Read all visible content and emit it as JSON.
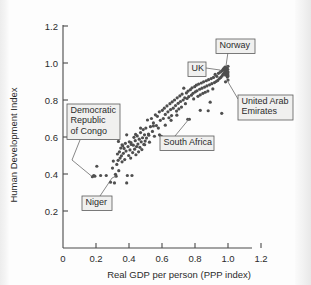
{
  "chart_data": {
    "type": "scatter",
    "title": "",
    "xlabel": "Real GDP per person (PPP index)",
    "ylabel": "Human Development Index",
    "xlim": [
      0,
      1.32
    ],
    "ylim": [
      0,
      1.3
    ],
    "xticks": [
      "0",
      "0.2",
      "0.4",
      "0.6",
      "0.8",
      "1.0",
      "1.2"
    ],
    "xtick_values": [
      0,
      0.2,
      0.4,
      0.6,
      0.8,
      1.0,
      1.2
    ],
    "yticks": [
      "0.2",
      "0.4",
      "0.6",
      "0.8",
      "1.0",
      "1.2"
    ],
    "ytick_values": [
      0.2,
      0.4,
      0.6,
      0.8,
      1.0,
      1.2
    ],
    "grid": false,
    "legend": "none",
    "marker_color": "#4f4f4f",
    "points": [
      [
        0.178,
        0.385
      ],
      [
        0.186,
        0.392
      ],
      [
        0.193,
        0.388
      ],
      [
        0.205,
        0.442
      ],
      [
        0.228,
        0.392
      ],
      [
        0.262,
        0.392
      ],
      [
        0.288,
        0.356
      ],
      [
        0.3,
        0.432
      ],
      [
        0.305,
        0.47
      ],
      [
        0.312,
        0.352
      ],
      [
        0.318,
        0.398
      ],
      [
        0.322,
        0.388
      ],
      [
        0.326,
        0.452
      ],
      [
        0.33,
        0.508
      ],
      [
        0.334,
        0.474
      ],
      [
        0.338,
        0.418
      ],
      [
        0.342,
        0.52
      ],
      [
        0.346,
        0.486
      ],
      [
        0.35,
        0.54
      ],
      [
        0.354,
        0.498
      ],
      [
        0.358,
        0.466
      ],
      [
        0.362,
        0.552
      ],
      [
        0.366,
        0.512
      ],
      [
        0.37,
        0.538
      ],
      [
        0.374,
        0.478
      ],
      [
        0.378,
        0.566
      ],
      [
        0.382,
        0.524
      ],
      [
        0.386,
        0.352
      ],
      [
        0.39,
        0.392
      ],
      [
        0.394,
        0.548
      ],
      [
        0.398,
        0.5
      ],
      [
        0.402,
        0.574
      ],
      [
        0.406,
        0.53
      ],
      [
        0.41,
        0.486
      ],
      [
        0.414,
        0.56
      ],
      [
        0.418,
        0.392
      ],
      [
        0.422,
        0.516
      ],
      [
        0.426,
        0.556
      ],
      [
        0.43,
        0.598
      ],
      [
        0.434,
        0.534
      ],
      [
        0.438,
        0.58
      ],
      [
        0.442,
        0.504
      ],
      [
        0.446,
        0.548
      ],
      [
        0.45,
        0.606
      ],
      [
        0.454,
        0.562
      ],
      [
        0.458,
        0.52
      ],
      [
        0.462,
        0.588
      ],
      [
        0.466,
        0.544
      ],
      [
        0.47,
        0.624
      ],
      [
        0.474,
        0.574
      ],
      [
        0.478,
        0.532
      ],
      [
        0.482,
        0.596
      ],
      [
        0.486,
        0.64
      ],
      [
        0.49,
        0.56
      ],
      [
        0.494,
        0.612
      ],
      [
        0.498,
        0.578
      ],
      [
        0.502,
        0.648
      ],
      [
        0.506,
        0.594
      ],
      [
        0.512,
        0.692
      ],
      [
        0.518,
        0.616
      ],
      [
        0.524,
        0.572
      ],
      [
        0.53,
        0.656
      ],
      [
        0.536,
        0.7
      ],
      [
        0.542,
        0.63
      ],
      [
        0.548,
        0.676
      ],
      [
        0.554,
        0.604
      ],
      [
        0.56,
        0.72
      ],
      [
        0.566,
        0.662
      ],
      [
        0.572,
        0.712
      ],
      [
        0.578,
        0.648
      ],
      [
        0.584,
        0.736
      ],
      [
        0.59,
        0.69
      ],
      [
        0.596,
        0.604
      ],
      [
        0.602,
        0.744
      ],
      [
        0.608,
        0.7
      ],
      [
        0.614,
        0.756
      ],
      [
        0.62,
        0.722
      ],
      [
        0.626,
        0.58
      ],
      [
        0.63,
        0.768
      ],
      [
        0.636,
        0.736
      ],
      [
        0.642,
        0.704
      ],
      [
        0.648,
        0.78
      ],
      [
        0.652,
        0.748
      ],
      [
        0.658,
        0.716
      ],
      [
        0.662,
        0.79
      ],
      [
        0.668,
        0.756
      ],
      [
        0.672,
        0.572
      ],
      [
        0.676,
        0.8
      ],
      [
        0.682,
        0.77
      ],
      [
        0.688,
        0.74
      ],
      [
        0.692,
        0.812
      ],
      [
        0.698,
        0.782
      ],
      [
        0.702,
        0.752
      ],
      [
        0.708,
        0.822
      ],
      [
        0.712,
        0.792
      ],
      [
        0.718,
        0.762
      ],
      [
        0.722,
        0.832
      ],
      [
        0.728,
        0.8
      ],
      [
        0.732,
        0.864
      ],
      [
        0.738,
        0.812
      ],
      [
        0.742,
        0.78
      ],
      [
        0.748,
        0.838
      ],
      [
        0.752,
        0.808
      ],
      [
        0.758,
        0.848
      ],
      [
        0.762,
        0.818
      ],
      [
        0.766,
        0.696
      ],
      [
        0.772,
        0.856
      ],
      [
        0.778,
        0.826
      ],
      [
        0.782,
        0.866
      ],
      [
        0.788,
        0.836
      ],
      [
        0.792,
        0.806
      ],
      [
        0.798,
        0.872
      ],
      [
        0.802,
        0.844
      ],
      [
        0.808,
        0.88
      ],
      [
        0.812,
        0.85
      ],
      [
        0.818,
        0.82
      ],
      [
        0.822,
        0.886
      ],
      [
        0.828,
        0.858
      ],
      [
        0.832,
        0.828
      ],
      [
        0.838,
        0.892
      ],
      [
        0.842,
        0.864
      ],
      [
        0.848,
        0.836
      ],
      [
        0.852,
        0.898
      ],
      [
        0.858,
        0.87
      ],
      [
        0.862,
        0.842
      ],
      [
        0.868,
        0.904
      ],
      [
        0.872,
        0.876
      ],
      [
        0.878,
        0.848
      ],
      [
        0.882,
        0.91
      ],
      [
        0.888,
        0.882
      ],
      [
        0.892,
        0.788
      ],
      [
        0.898,
        0.916
      ],
      [
        0.902,
        0.888
      ],
      [
        0.908,
        0.86
      ],
      [
        0.912,
        0.922
      ],
      [
        0.918,
        0.894
      ],
      [
        0.922,
        0.938
      ],
      [
        0.928,
        0.9
      ],
      [
        0.932,
        0.928
      ],
      [
        0.938,
        0.906
      ],
      [
        0.942,
        0.944
      ],
      [
        0.948,
        0.916
      ],
      [
        0.952,
        0.95
      ],
      [
        0.956,
        0.922
      ],
      [
        0.96,
        0.956
      ],
      [
        0.964,
        0.93
      ],
      [
        0.968,
        0.962
      ],
      [
        0.97,
        0.938
      ],
      [
        0.972,
        0.968
      ],
      [
        0.976,
        0.944
      ],
      [
        0.978,
        0.972
      ],
      [
        0.98,
        0.952
      ],
      [
        0.982,
        0.978
      ],
      [
        0.984,
        0.96
      ],
      [
        0.986,
        0.934
      ],
      [
        0.988,
        0.968
      ],
      [
        0.99,
        0.946
      ],
      [
        0.992,
        0.976
      ],
      [
        0.994,
        0.956
      ],
      [
        0.996,
        0.924
      ],
      [
        0.998,
        0.966
      ],
      [
        0.999,
        0.94
      ],
      [
        1.0,
        0.982
      ],
      [
        1.0,
        0.908
      ],
      [
        1.0,
        0.93
      ],
      [
        1.0,
        0.952
      ],
      [
        0.985,
        0.898
      ],
      [
        0.962,
        0.728
      ],
      [
        0.88,
        0.742
      ],
      [
        0.832,
        0.744
      ],
      [
        0.756,
        0.696
      ],
      [
        0.69,
        0.718
      ],
      [
        0.655,
        0.69
      ],
      [
        0.62,
        0.664
      ],
      [
        0.585,
        0.612
      ],
      [
        0.548,
        0.66
      ],
      [
        0.52,
        0.61
      ],
      [
        0.495,
        0.558
      ],
      [
        0.47,
        0.648
      ],
      [
        0.44,
        0.614
      ],
      [
        0.412,
        0.57
      ],
      [
        0.386,
        0.612
      ],
      [
        0.358,
        0.558
      ],
      [
        0.336,
        0.576
      ]
    ],
    "annotations": [
      {
        "id": "drc",
        "label": "Democratic\nRepublic\nof Congo",
        "lines": [
          "Democratic",
          "Republic",
          "of Congo"
        ],
        "point": [
          0.178,
          0.385
        ]
      },
      {
        "id": "niger",
        "label": "Niger",
        "lines": [
          "Niger"
        ],
        "point": [
          0.322,
          0.388
        ]
      },
      {
        "id": "south-africa",
        "label": "South Africa",
        "lines": [
          "South Africa"
        ],
        "point": [
          0.756,
          0.696
        ]
      },
      {
        "id": "uk",
        "label": "UK",
        "lines": [
          "UK"
        ],
        "point": [
          0.952,
          0.95
        ]
      },
      {
        "id": "norway",
        "label": "Norway",
        "lines": [
          "Norway"
        ],
        "point": [
          1.0,
          0.982
        ]
      },
      {
        "id": "uae",
        "label": "United Arab\nEmirates",
        "lines": [
          "United Arab",
          "Emirates"
        ],
        "point": [
          1.0,
          0.908
        ]
      }
    ]
  }
}
